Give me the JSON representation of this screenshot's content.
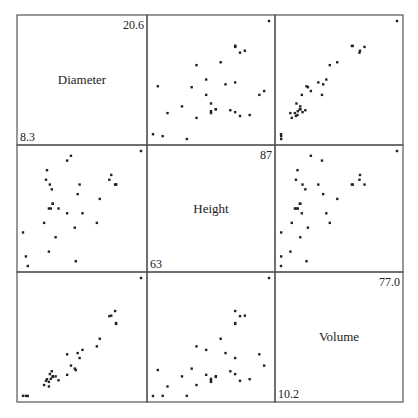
{
  "chart_data": {
    "type": "scatter",
    "title": "",
    "layout": "scatterplot-matrix 3x3",
    "variables": [
      {
        "name": "Diameter",
        "min": "8.3",
        "max": "20.6"
      },
      {
        "name": "Height",
        "min": "63",
        "max": "87"
      },
      {
        "name": "Volume",
        "min": "10.2",
        "max": "77.0"
      }
    ],
    "grid": false,
    "Diameter": [
      8.3,
      8.6,
      8.8,
      10.5,
      10.7,
      10.8,
      11.0,
      11.0,
      11.1,
      11.2,
      11.3,
      11.4,
      11.4,
      11.7,
      12.0,
      12.9,
      12.9,
      13.3,
      13.7,
      13.8,
      14.0,
      14.2,
      14.5,
      16.0,
      16.3,
      17.3,
      17.5,
      17.9,
      18.0,
      18.0,
      20.6
    ],
    "Height": [
      70,
      65,
      63,
      72,
      81,
      83,
      66,
      75,
      80,
      75,
      79,
      76,
      76,
      69,
      75,
      74,
      85,
      86,
      71,
      64,
      78,
      80,
      74,
      72,
      77,
      81,
      82,
      80,
      80,
      80,
      87
    ],
    "Volume": [
      10.3,
      10.3,
      10.2,
      16.4,
      18.8,
      19.7,
      15.6,
      18.2,
      22.6,
      19.9,
      24.2,
      21.0,
      21.4,
      21.3,
      19.1,
      22.2,
      33.8,
      27.4,
      25.7,
      24.9,
      34.5,
      31.7,
      36.3,
      38.3,
      42.6,
      55.4,
      55.7,
      58.3,
      51.5,
      51.0,
      77.0
    ]
  }
}
